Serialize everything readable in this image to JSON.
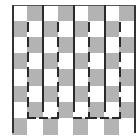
{
  "diagram": {
    "type": "checkerboard-maze",
    "grid": {
      "columns": 8,
      "rows": 8,
      "origin_x": 12,
      "origin_y": 5,
      "cell_w": 15.25,
      "cell_h": 16.1
    },
    "colors": {
      "dark_cell": "#b3b3b3",
      "light_cell": "#ffffff",
      "line": "#2a2a2a"
    },
    "solid_lines": [
      {
        "x": 42,
        "y1": 5,
        "y2": 112
      },
      {
        "x": 73,
        "y1": 5,
        "y2": 112
      },
      {
        "x": 104,
        "y1": 5,
        "y2": 112
      }
    ],
    "dashed_vertical_lines": [
      {
        "x": 27,
        "y1": 22,
        "y2": 118
      },
      {
        "x": 57,
        "y1": 22,
        "y2": 118
      },
      {
        "x": 88,
        "y1": 22,
        "y2": 118
      },
      {
        "x": 119,
        "y1": 22,
        "y2": 118
      }
    ],
    "dashed_horizontal_lines": [
      {
        "y": 117,
        "x1": 27,
        "x2": 57
      },
      {
        "y": 117,
        "x1": 73,
        "x2": 88
      },
      {
        "y": 117,
        "x1": 88,
        "x2": 119
      }
    ]
  }
}
